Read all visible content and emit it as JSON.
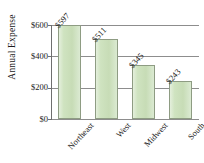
{
  "chart_data": {
    "type": "bar",
    "title": "",
    "xlabel": "",
    "ylabel": "Annual Expense",
    "categories": [
      "Northeast",
      "West",
      "Midwest",
      "South"
    ],
    "values": [
      597,
      511,
      345,
      243
    ],
    "value_labels": [
      "$597",
      "$511",
      "$345",
      "$243"
    ],
    "ytick_labels": [
      "$600",
      "$400",
      "$200",
      "$0"
    ],
    "ytick_values": [
      600,
      400,
      200,
      0
    ],
    "ylim": [
      0,
      600
    ],
    "grid": "horizontal",
    "legend": "none",
    "bar_color": "#cfe3c0",
    "bar_edge_color": "#8e9c83",
    "background_color": "#ffffff"
  }
}
